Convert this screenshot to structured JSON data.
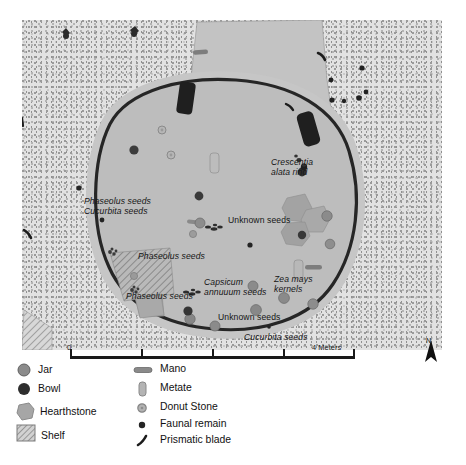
{
  "figure": {
    "type": "archaeological-site-plan",
    "caption": ""
  },
  "map": {
    "labels": [
      {
        "id": "crescentia",
        "text_line1": "Crescentia",
        "text_line2": "alata rind",
        "x": 249,
        "y": 142,
        "style": "italic-two-line"
      },
      {
        "id": "phaseolus-1",
        "text": "Phaseolus seeds",
        "x": 62,
        "y": 180,
        "style": "italic"
      },
      {
        "id": "cucurbita-1",
        "text": "Cucurbita seeds",
        "x": 62,
        "y": 190,
        "style": "italic"
      },
      {
        "id": "unknown-seeds-1",
        "text": "Unknown seeds",
        "x": 206,
        "y": 199,
        "style": "plain"
      },
      {
        "id": "phaseolus-2",
        "text": "Phaseolus seeds",
        "x": 116,
        "y": 235,
        "style": "italic"
      },
      {
        "id": "phaseolus-3",
        "text": "Phaseolus seeds",
        "x": 114,
        "y": 275,
        "style": "italic"
      },
      {
        "id": "capsicum",
        "text_line1": "Capsicum",
        "text_line2": "annuuum seeds",
        "x": 182,
        "y": 262,
        "style": "italic-two-line"
      },
      {
        "id": "zea-mays",
        "text_line1": "Zea mays",
        "text_line2": "kernels",
        "x": 252,
        "y": 259,
        "style": "italic-two-line"
      },
      {
        "id": "unknown-seeds-2",
        "text": "Unknown seeds",
        "x": 200,
        "y": 296,
        "style": "plain"
      },
      {
        "id": "cucurbita-2",
        "text": "Cucurbita seeds",
        "x": 225,
        "y": 316,
        "style": "italic"
      }
    ]
  },
  "scale": {
    "zero_label": "0",
    "max_label": "4 Meters",
    "north_label": "N"
  },
  "legend": {
    "column_a": [
      {
        "symbol": "jar-symbol",
        "label": "Jar"
      },
      {
        "symbol": "bowl-symbol",
        "label": "Bowl"
      },
      {
        "symbol": "hearthstone-symbol",
        "label": "Hearthstone"
      },
      {
        "symbol": "shelf-symbol",
        "label": "Shelf"
      }
    ],
    "column_b": [
      {
        "symbol": "mano-symbol",
        "label": "Mano"
      },
      {
        "symbol": "metate-symbol",
        "label": "Metate"
      },
      {
        "symbol": "donut-stone-symbol",
        "label": "Donut Stone"
      },
      {
        "symbol": "faunal-remain-symbol",
        "label": "Faunal remain"
      },
      {
        "symbol": "prismatic-blade-symbol",
        "label": "Prismatic blade"
      }
    ]
  },
  "colors": {
    "ground": "#e2e2e2",
    "floor": "#c0c0c0",
    "floor_inner": "#bdbdbd",
    "wall": "#2b2b2b",
    "doorway": "#232323",
    "jar": "#8e8e8e",
    "bowl": "#3a3a3a",
    "hearthstone": "#a9a9a9",
    "shelf_hatch": "#909090",
    "metate": "#b6b6b6",
    "faunal": "#262626"
  }
}
